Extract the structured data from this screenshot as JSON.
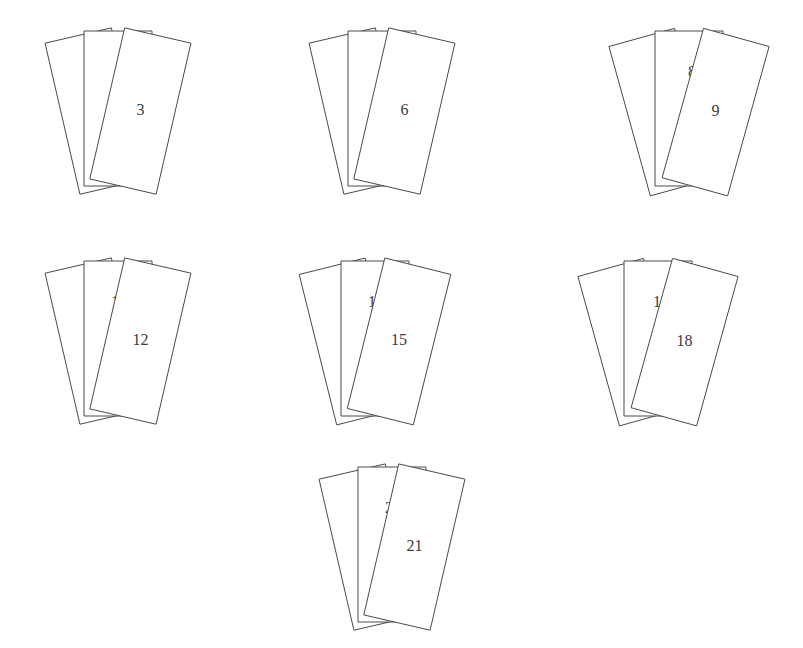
{
  "figure": {
    "canvas": {
      "width": 803,
      "height": 648
    },
    "background_color": "#ffffff",
    "stroke_color": "#4a4a4a",
    "fill_color": "#ffffff",
    "label_color": "#3b3b3b",
    "stroke_width": 1,
    "label_font_size": 16,
    "rows": [
      3,
      3,
      1
    ],
    "cards_per_group": 3,
    "total_cards": 21,
    "stacking_order": "left card lowest, middle card above it, right card on top"
  },
  "groups": [
    {
      "id": "group-1",
      "row": 1,
      "column": 1,
      "cards": [
        {
          "label": "1",
          "position": "left",
          "label_x": 66,
          "label_y": 109,
          "points": "20,50 86,28 124,182 58,204"
        },
        {
          "label": "2",
          "position": "middle",
          "label_x": 117,
          "label_y": 70,
          "points": "84,31 152,31 152,185 84,185"
        },
        {
          "label": "3",
          "position": "right",
          "label_x": 168,
          "label_y": 110,
          "points": "150,31 216,56 182,206 116,181"
        }
      ]
    },
    {
      "id": "group-2",
      "row": 1,
      "column": 2,
      "cards": [
        {
          "label": "4",
          "position": "left",
          "label_x": 331,
          "label_y": 110,
          "points": "274,52 342,29 380,182 312,205"
        },
        {
          "label": "5",
          "position": "middle",
          "label_x": 382,
          "label_y": 72,
          "points": "340,30 407,30 407,185 340,185"
        },
        {
          "label": "6",
          "position": "right",
          "label_x": 434,
          "label_y": 111,
          "points": "405,30 471,55 437,206 371,181"
        }
      ]
    },
    {
      "id": "group-3",
      "row": 1,
      "column": 3,
      "cards": [
        {
          "label": "7",
          "position": "left",
          "label_x": 636,
          "label_y": 120,
          "points": "574,70 645,37 448,0 0,0"
        },
        {
          "label": "8",
          "position": "middle",
          "label_x": 689,
          "label_y": 85,
          "points": "643,39 716,39 716,190 643,190"
        },
        {
          "label": "9",
          "position": "right",
          "label_x": 744,
          "label_y": 123,
          "points": "714,39 783,70 749,212 680,186"
        }
      ]
    },
    {
      "id": "group-4",
      "row": 2,
      "column": 1,
      "cards": [
        {
          "label": "10",
          "position": "left",
          "label_x": 68,
          "label_y": 340,
          "points": "20,280 86,259 124,413 58,434"
        },
        {
          "label": "11",
          "position": "middle",
          "label_x": 118,
          "label_y": 297,
          "points": "84,261 152,261 152,416 84,416"
        },
        {
          "label": "12",
          "position": "right",
          "label_x": 170,
          "label_y": 340,
          "points": "150,261 216,286 182,437 116,412"
        }
      ]
    },
    {
      "id": "group-5",
      "row": 2,
      "column": 2,
      "cards": [
        {
          "label": "13",
          "position": "left",
          "label_x": 325,
          "label_y": 343,
          "points": "260,288 340,258 378,412 299,442"
        },
        {
          "label": "14",
          "position": "middle",
          "label_x": 375,
          "label_y": 296,
          "points": "338,259 404,259 404,414 338,414"
        },
        {
          "label": "15",
          "position": "right",
          "label_x": 420,
          "label_y": 344,
          "points": "402,259 470,286 436,437 368,410"
        }
      ]
    },
    {
      "id": "group-6",
      "row": 2,
      "column": 3,
      "cards": [
        {
          "label": "16",
          "position": "left",
          "label_x": 597,
          "label_y": 345,
          "points": "541,290 621,259 659,413 579,444"
        },
        {
          "label": "17",
          "position": "middle",
          "label_x": 658,
          "label_y": 310,
          "points": "619,260 692,260 692,418 619,418"
        },
        {
          "label": "18",
          "position": "right",
          "label_x": 718,
          "label_y": 345,
          "points": "690,260 778,291 744,442 656,412"
        }
      ]
    },
    {
      "id": "group-7",
      "row": 3,
      "column": 1,
      "cards": [
        {
          "label": "19",
          "position": "left",
          "label_x": 338,
          "label_y": 549,
          "points": "276,496 356,466 394,620 314,650"
        },
        {
          "label": "20",
          "position": "middle",
          "label_x": 392,
          "label_y": 507,
          "points": "354,467 423,467 423,622 354,622"
        },
        {
          "label": "21",
          "position": "right",
          "label_x": 444,
          "label_y": 549,
          "points": "421,467 494,492 460,645 387,620"
        }
      ]
    }
  ]
}
